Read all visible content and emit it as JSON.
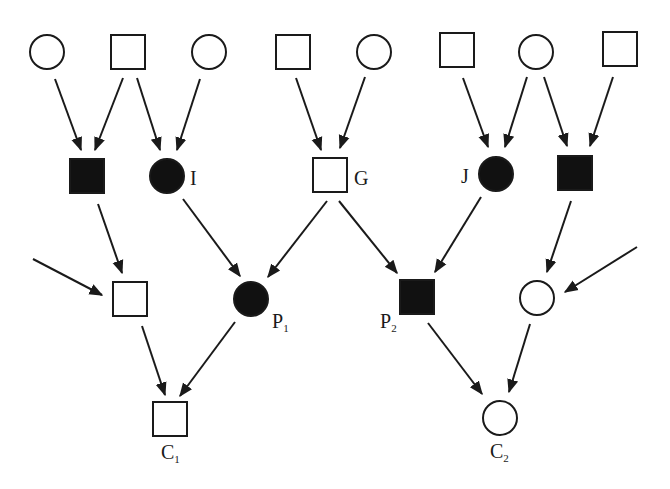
{
  "diagram": {
    "type": "pedigree",
    "colors": {
      "stroke": "#1a1a1a",
      "affected_fill": "#111111",
      "unaffected_fill": "#ffffff",
      "background": "#ffffff"
    },
    "nodes": [
      {
        "id": "t1",
        "shape": "circle",
        "affected": false,
        "x": 47,
        "y": 52,
        "label": ""
      },
      {
        "id": "t2",
        "shape": "square",
        "affected": false,
        "x": 128,
        "y": 52,
        "label": ""
      },
      {
        "id": "t3",
        "shape": "circle",
        "affected": false,
        "x": 209,
        "y": 52,
        "label": ""
      },
      {
        "id": "t4",
        "shape": "square",
        "affected": false,
        "x": 293,
        "y": 52,
        "label": ""
      },
      {
        "id": "t5",
        "shape": "circle",
        "affected": false,
        "x": 374,
        "y": 52,
        "label": ""
      },
      {
        "id": "t6",
        "shape": "square",
        "affected": false,
        "x": 457,
        "y": 50,
        "label": ""
      },
      {
        "id": "t7",
        "shape": "circle",
        "affected": false,
        "x": 536,
        "y": 52,
        "label": ""
      },
      {
        "id": "t8",
        "shape": "square",
        "affected": false,
        "x": 620,
        "y": 49,
        "label": ""
      },
      {
        "id": "m1",
        "shape": "square",
        "affected": true,
        "x": 87,
        "y": 176,
        "label": ""
      },
      {
        "id": "I",
        "shape": "circle",
        "affected": true,
        "x": 167,
        "y": 176,
        "label": "I"
      },
      {
        "id": "G",
        "shape": "square",
        "affected": false,
        "x": 330,
        "y": 175,
        "label": "G"
      },
      {
        "id": "J",
        "shape": "circle",
        "affected": true,
        "x": 496,
        "y": 174,
        "label": "J"
      },
      {
        "id": "m5",
        "shape": "square",
        "affected": true,
        "x": 575,
        "y": 173,
        "label": ""
      },
      {
        "id": "b1",
        "shape": "square",
        "affected": false,
        "x": 130,
        "y": 299,
        "label": ""
      },
      {
        "id": "P1",
        "shape": "circle",
        "affected": true,
        "x": 251,
        "y": 299,
        "label": "P",
        "sub": "1"
      },
      {
        "id": "P2",
        "shape": "square",
        "affected": true,
        "x": 417,
        "y": 297,
        "label": "P",
        "sub": "2"
      },
      {
        "id": "b4",
        "shape": "circle",
        "affected": false,
        "x": 537,
        "y": 298,
        "label": ""
      },
      {
        "id": "C1",
        "shape": "square",
        "affected": false,
        "x": 170,
        "y": 419,
        "label": "C",
        "sub": "1"
      },
      {
        "id": "C2",
        "shape": "circle",
        "affected": false,
        "x": 500,
        "y": 418,
        "label": "C",
        "sub": "2"
      }
    ],
    "labels": [
      {
        "text": "I",
        "sub": "",
        "x": 190,
        "y": 185
      },
      {
        "text": "G",
        "sub": "",
        "x": 354,
        "y": 185
      },
      {
        "text": "J",
        "sub": "",
        "x": 461,
        "y": 183
      },
      {
        "text": "P",
        "sub": "1",
        "x": 272,
        "y": 328
      },
      {
        "text": "P",
        "sub": "2",
        "x": 380,
        "y": 328
      },
      {
        "text": "C",
        "sub": "1",
        "x": 161,
        "y": 459
      },
      {
        "text": "C",
        "sub": "2",
        "x": 490,
        "y": 458
      }
    ],
    "edges": [
      {
        "from": "t1",
        "to": "m1",
        "x1": 55,
        "y1": 79,
        "x2": 81,
        "y2": 150
      },
      {
        "from": "t2",
        "to": "m1",
        "x1": 123,
        "y1": 78,
        "x2": 95,
        "y2": 150
      },
      {
        "from": "t2",
        "to": "I",
        "x1": 137,
        "y1": 78,
        "x2": 160,
        "y2": 150
      },
      {
        "from": "t3",
        "to": "I",
        "x1": 200,
        "y1": 79,
        "x2": 177,
        "y2": 150
      },
      {
        "from": "t4",
        "to": "G",
        "x1": 296,
        "y1": 78,
        "x2": 321,
        "y2": 150
      },
      {
        "from": "t5",
        "to": "G",
        "x1": 365,
        "y1": 77,
        "x2": 340,
        "y2": 148
      },
      {
        "from": "t6",
        "to": "J",
        "x1": 463,
        "y1": 78,
        "x2": 488,
        "y2": 147
      },
      {
        "from": "t7",
        "to": "J",
        "x1": 527,
        "y1": 77,
        "x2": 505,
        "y2": 147
      },
      {
        "from": "t7",
        "to": "m5",
        "x1": 544,
        "y1": 77,
        "x2": 567,
        "y2": 146
      },
      {
        "from": "t8",
        "to": "m5",
        "x1": 613,
        "y1": 77,
        "x2": 590,
        "y2": 146
      },
      {
        "from": "m1",
        "to": "b1",
        "x1": 98,
        "y1": 204,
        "x2": 122,
        "y2": 273
      },
      {
        "from": "ext-left",
        "to": "b1",
        "x1": 33,
        "y1": 259,
        "x2": 102,
        "y2": 295
      },
      {
        "from": "I",
        "to": "P1",
        "x1": 183,
        "y1": 199,
        "x2": 240,
        "y2": 276
      },
      {
        "from": "G",
        "to": "P1",
        "x1": 327,
        "y1": 201,
        "x2": 268,
        "y2": 277
      },
      {
        "from": "G",
        "to": "P2",
        "x1": 339,
        "y1": 201,
        "x2": 397,
        "y2": 273
      },
      {
        "from": "J",
        "to": "P2",
        "x1": 481,
        "y1": 197,
        "x2": 435,
        "y2": 272
      },
      {
        "from": "m5",
        "to": "b4",
        "x1": 571,
        "y1": 201,
        "x2": 547,
        "y2": 272
      },
      {
        "from": "ext-right",
        "to": "b4",
        "x1": 637,
        "y1": 247,
        "x2": 565,
        "y2": 292
      },
      {
        "from": "b1",
        "to": "C1",
        "x1": 142,
        "y1": 326,
        "x2": 165,
        "y2": 395
      },
      {
        "from": "P1",
        "to": "C1",
        "x1": 235,
        "y1": 322,
        "x2": 180,
        "y2": 396
      },
      {
        "from": "P2",
        "to": "C2",
        "x1": 428,
        "y1": 323,
        "x2": 482,
        "y2": 394
      },
      {
        "from": "b4",
        "to": "C2",
        "x1": 530,
        "y1": 324,
        "x2": 509,
        "y2": 392
      }
    ]
  }
}
